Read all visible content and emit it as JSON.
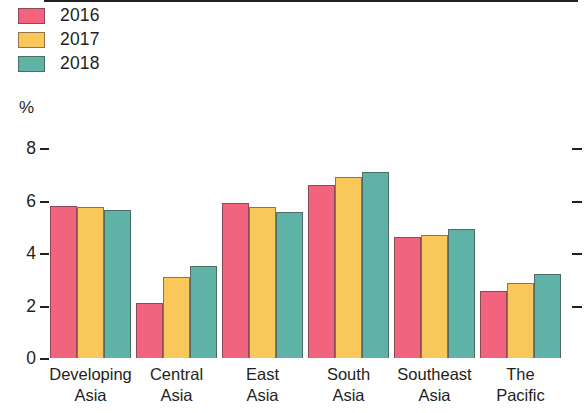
{
  "legend": {
    "items": [
      {
        "label": "2016",
        "color": "#F2637E"
      },
      {
        "label": "2017",
        "color": "#FAC85A"
      },
      {
        "label": "2018",
        "color": "#5FB3A6"
      }
    ]
  },
  "axis": {
    "unit": "%",
    "yticks": [
      "0",
      "2",
      "4",
      "6",
      "8"
    ]
  },
  "categories": [
    {
      "line1": "Developing",
      "line2": "Asia"
    },
    {
      "line1": "Central",
      "line2": "Asia"
    },
    {
      "line1": "East",
      "line2": "Asia"
    },
    {
      "line1": "South",
      "line2": "Asia"
    },
    {
      "line1": "Southeast",
      "line2": "Asia"
    },
    {
      "line1": "The",
      "line2": "Pacific"
    }
  ],
  "chart_data": {
    "type": "bar",
    "title": "",
    "xlabel": "",
    "ylabel": "%",
    "ylim": [
      0,
      8
    ],
    "ytick_values": [
      0,
      2,
      4,
      6,
      8
    ],
    "grid": false,
    "legend_position": "top-left",
    "categories": [
      "Developing Asia",
      "Central Asia",
      "East Asia",
      "South Asia",
      "Southeast Asia",
      "The Pacific"
    ],
    "series": [
      {
        "name": "2016",
        "color": "#F2637E",
        "values": [
          5.8,
          2.1,
          5.9,
          6.6,
          4.6,
          2.55
        ]
      },
      {
        "name": "2017",
        "color": "#FAC85A",
        "values": [
          5.75,
          3.1,
          5.75,
          6.9,
          4.7,
          2.85
        ]
      },
      {
        "name": "2018",
        "color": "#5FB3A6",
        "values": [
          5.65,
          3.5,
          5.55,
          7.1,
          4.9,
          3.2
        ]
      }
    ]
  },
  "geometry": {
    "baseline_y": 358,
    "px_per_unit": 26.25,
    "group_start_x": 50,
    "group_pitch": 86,
    "bar_width": 27
  }
}
